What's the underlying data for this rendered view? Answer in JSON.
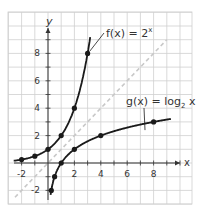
{
  "chart_data": {
    "type": "line",
    "title": "",
    "xlabel": "x",
    "ylabel": "y",
    "xlim": [
      -3,
      11
    ],
    "ylim": [
      -3,
      11
    ],
    "grid": true,
    "x_ticks": [
      "-2",
      "2",
      "4",
      "6",
      "8"
    ],
    "y_ticks": [
      "8",
      "6",
      "4",
      "2",
      "-2"
    ],
    "series": [
      {
        "name": "f(x) = 2^x",
        "label": "f(x) = 2",
        "label_sup": "x",
        "points": [
          [
            -2,
            0.25
          ],
          [
            -1,
            0.5
          ],
          [
            0,
            1
          ],
          [
            1,
            2
          ],
          [
            2,
            4
          ],
          [
            3,
            8
          ]
        ]
      },
      {
        "name": "g(x) = log2 x",
        "label": "g(x) = log",
        "label_sub": "2",
        "label_tail": " x",
        "points": [
          [
            0.25,
            -2
          ],
          [
            0.5,
            -1
          ],
          [
            1,
            0
          ],
          [
            2,
            1
          ],
          [
            4,
            2
          ],
          [
            8,
            3
          ]
        ]
      },
      {
        "name": "y = x",
        "style": "dashed",
        "points": [
          [
            -2.5,
            -2.5
          ],
          [
            9,
            9
          ]
        ]
      }
    ]
  },
  "colors": {
    "grid": "#cfcfcf",
    "curve": "#1a1a1a",
    "dashed": "#c8c8c8",
    "axis": "#333333"
  }
}
